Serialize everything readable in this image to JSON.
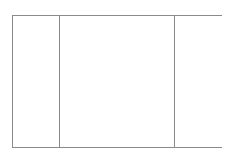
{
  "document": {
    "title": "Trifold Panel Diagram",
    "background_color": "#ffffff"
  },
  "diagram": {
    "type": "line-drawing",
    "stroke_color": "#8a8a8a",
    "stroke_width": 1,
    "fill_color": "#ffffff",
    "frame": {
      "x": 12,
      "y": 15,
      "width": 210,
      "height": 133,
      "right": 222,
      "bottom": 148
    },
    "dividers": [
      {
        "name": "divider-left",
        "x": 59,
        "y_top": 15,
        "y_bottom": 148
      },
      {
        "name": "divider-right",
        "x": 174,
        "y_top": 15,
        "y_bottom": 148
      }
    ],
    "panels": [
      {
        "name": "panel-left",
        "x": 12,
        "width": 47,
        "label": ""
      },
      {
        "name": "panel-center",
        "x": 59,
        "width": 115,
        "label": ""
      },
      {
        "name": "panel-right",
        "x": 174,
        "width": 48,
        "label": ""
      }
    ]
  }
}
